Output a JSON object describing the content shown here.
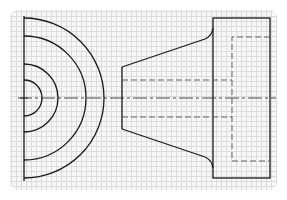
{
  "drawing": {
    "type": "orthographic-projection",
    "views": [
      "end-view-half-circles",
      "side-view-tapered-flange"
    ],
    "colors": {
      "grid_background": "#f7f7f7",
      "grid_line": "#dcdcdc",
      "visible_line": "#1a1a1a",
      "hidden_line": "#555555",
      "center_line": "#333333"
    },
    "grid_spacing_px": 5,
    "end_view": {
      "center": [
        24,
        98
      ],
      "arc_radii": [
        18,
        34,
        62,
        80
      ]
    },
    "side_view": {
      "cone_small_end_x": 122,
      "cone_small_end_y": [
        67,
        129
      ],
      "flange_rect": {
        "x": 213,
        "y": 18,
        "w": 57,
        "h": 160
      },
      "hidden_bore_y": [
        80,
        117
      ],
      "hidden_pocket": {
        "x": 232,
        "y": 37,
        "w": 38,
        "h": 124
      }
    }
  }
}
